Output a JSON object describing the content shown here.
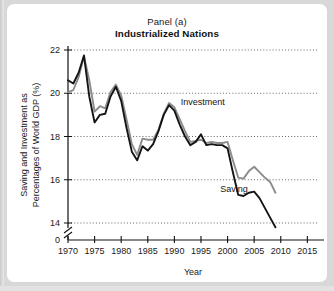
{
  "figure": {
    "title_line1": "Panel (a)",
    "title_line2": "Industrialized Nations",
    "background_color": "#d8d8d8",
    "card_color": "#ffffff"
  },
  "chart_data": {
    "type": "line",
    "title": "Panel (a) Industrialized Nations",
    "subtitle": "Industrialized Nations",
    "xlabel": "Year",
    "ylabel": "Saving and Investment as Percentages of World GDP (%)",
    "ylabel_line1": "Saving and Investment as",
    "ylabel_line2": "Percentages of World GDP (%)",
    "xlim": [
      1970,
      2017
    ],
    "ylim": [
      13.0,
      22.0
    ],
    "xticks": [
      1970,
      1975,
      1980,
      1985,
      1990,
      1995,
      2000,
      2005,
      2010,
      2015
    ],
    "xtick_labels": [
      "1970",
      "1975",
      "1980",
      "1985",
      "1990",
      "1995",
      "2000",
      "2005",
      "2010",
      "2015"
    ],
    "yticks": [
      14,
      16,
      18,
      20,
      22
    ],
    "ytick_labels": [
      "14",
      "16",
      "18",
      "20",
      "22"
    ],
    "y_origin_label": "0",
    "axis_break": true,
    "grid": "horizontal-dotted",
    "legend_position": "inline-annotation",
    "x": [
      1970,
      1971,
      1972,
      1973,
      1974,
      1975,
      1976,
      1977,
      1978,
      1979,
      1980,
      1981,
      1982,
      1983,
      1984,
      1985,
      1986,
      1987,
      1988,
      1989,
      1990,
      1991,
      1992,
      1993,
      1994,
      1995,
      1996,
      1997,
      1998,
      1999,
      2000,
      2001,
      2002,
      2003,
      2004,
      2005,
      2006,
      2007,
      2008,
      2009
    ],
    "series": [
      {
        "name": "Investment",
        "color": "#8c8c8c",
        "label_x": 1991.2,
        "label_y": 19.45,
        "values": [
          20.05,
          20.15,
          20.75,
          21.7,
          20.6,
          19.15,
          19.4,
          19.3,
          20.05,
          20.4,
          19.9,
          18.8,
          17.65,
          17.15,
          17.9,
          17.85,
          17.85,
          18.3,
          19.05,
          19.55,
          19.35,
          18.8,
          18.25,
          17.75,
          17.8,
          17.85,
          17.7,
          17.75,
          17.7,
          17.7,
          17.75,
          16.9,
          16.1,
          16.05,
          16.4,
          16.6,
          16.35,
          16.1,
          15.9,
          15.4
        ]
      },
      {
        "name": "Saving",
        "color": "#141414",
        "label_x": 1998.6,
        "label_y": 15.45,
        "values": [
          20.6,
          20.45,
          20.95,
          21.75,
          19.85,
          18.65,
          19.0,
          19.05,
          19.85,
          20.3,
          19.65,
          18.4,
          17.3,
          16.9,
          17.55,
          17.35,
          17.65,
          18.25,
          19.0,
          19.45,
          19.2,
          18.55,
          18.0,
          17.6,
          17.75,
          18.1,
          17.6,
          17.65,
          17.6,
          17.6,
          17.45,
          16.35,
          15.3,
          15.25,
          15.4,
          15.45,
          15.15,
          14.7,
          14.25,
          13.8
        ]
      }
    ]
  }
}
